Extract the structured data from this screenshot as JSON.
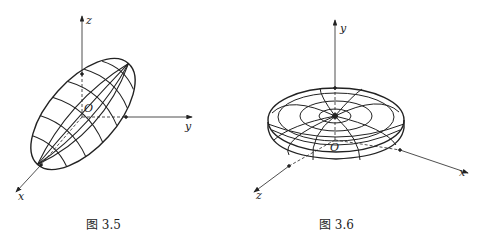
{
  "figures": [
    {
      "caption": "图 3.5",
      "description": "Prolate ellipsoid tilted along x-y direction with meridian/parallel grid lines",
      "axes": {
        "x": "x",
        "y": "y",
        "z": "z",
        "origin": "O"
      }
    },
    {
      "caption": "图 3.6",
      "description": "Oblate ellipsoid (flattened disk) centered on y-axis with concentric rings and meridians",
      "axes": {
        "x": "x",
        "y": "y",
        "z": "z",
        "origin": "O"
      }
    }
  ]
}
